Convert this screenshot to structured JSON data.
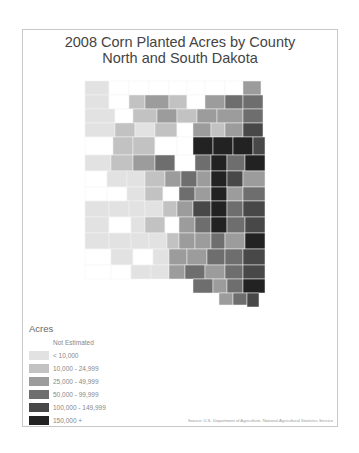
{
  "title": {
    "line1": "2008 Corn Planted Acres by County",
    "line2": "North and South Dakota"
  },
  "legend": {
    "title": "Acres",
    "classes": [
      {
        "label": "Not Estimated",
        "color": "#ffffff"
      },
      {
        "label": "< 10,000",
        "color": "#e2e2e2"
      },
      {
        "label": "10,000 - 24,999",
        "color": "#c2c2c2"
      },
      {
        "label": "25,000 - 49,999",
        "color": "#9c9c9c"
      },
      {
        "label": "50,000 - 99,999",
        "color": "#6e6e6e"
      },
      {
        "label": "100,000 - 149,999",
        "color": "#484848"
      },
      {
        "label": "150,000 +",
        "color": "#222222"
      }
    ]
  },
  "source": "Source: U.S. Department of Agriculture, National Agricultural Statistics Service",
  "map": {
    "states": [
      "North Dakota",
      "South Dakota"
    ],
    "counties": [
      [
        62,
        51,
        24,
        14,
        1
      ],
      [
        86,
        51,
        20,
        14,
        0
      ],
      [
        106,
        51,
        20,
        14,
        0
      ],
      [
        126,
        51,
        20,
        14,
        0
      ],
      [
        146,
        51,
        18,
        14,
        0
      ],
      [
        164,
        51,
        18,
        14,
        0
      ],
      [
        182,
        51,
        20,
        14,
        0
      ],
      [
        202,
        51,
        18,
        14,
        0
      ],
      [
        220,
        51,
        18,
        14,
        3
      ],
      [
        62,
        65,
        24,
        14,
        1
      ],
      [
        86,
        65,
        20,
        14,
        0
      ],
      [
        106,
        65,
        16,
        14,
        2
      ],
      [
        122,
        65,
        24,
        14,
        3
      ],
      [
        146,
        65,
        18,
        14,
        2
      ],
      [
        164,
        65,
        18,
        14,
        0
      ],
      [
        182,
        65,
        20,
        14,
        3
      ],
      [
        202,
        65,
        18,
        14,
        4
      ],
      [
        220,
        65,
        20,
        14,
        4
      ],
      [
        62,
        79,
        30,
        14,
        1
      ],
      [
        92,
        79,
        18,
        14,
        0
      ],
      [
        110,
        79,
        24,
        14,
        2
      ],
      [
        134,
        79,
        20,
        14,
        3
      ],
      [
        154,
        79,
        20,
        14,
        2
      ],
      [
        174,
        79,
        20,
        14,
        3
      ],
      [
        194,
        79,
        26,
        14,
        3
      ],
      [
        220,
        79,
        20,
        14,
        4
      ],
      [
        62,
        93,
        30,
        14,
        1
      ],
      [
        92,
        93,
        20,
        14,
        2
      ],
      [
        112,
        93,
        20,
        14,
        1
      ],
      [
        132,
        93,
        22,
        14,
        2
      ],
      [
        154,
        93,
        16,
        14,
        0
      ],
      [
        170,
        93,
        18,
        14,
        3
      ],
      [
        188,
        93,
        14,
        14,
        2
      ],
      [
        202,
        93,
        18,
        14,
        3
      ],
      [
        220,
        93,
        20,
        14,
        5
      ],
      [
        62,
        107,
        28,
        18,
        0
      ],
      [
        90,
        107,
        20,
        18,
        2
      ],
      [
        110,
        107,
        22,
        18,
        2
      ],
      [
        132,
        107,
        22,
        18,
        0
      ],
      [
        154,
        107,
        16,
        18,
        0
      ],
      [
        170,
        107,
        20,
        18,
        6
      ],
      [
        190,
        107,
        20,
        18,
        6
      ],
      [
        210,
        107,
        20,
        18,
        6
      ],
      [
        230,
        107,
        12,
        18,
        5
      ],
      [
        62,
        125,
        26,
        16,
        1
      ],
      [
        88,
        125,
        22,
        16,
        2
      ],
      [
        110,
        125,
        22,
        16,
        3
      ],
      [
        132,
        125,
        20,
        16,
        4
      ],
      [
        152,
        125,
        20,
        16,
        0
      ],
      [
        172,
        125,
        16,
        16,
        4
      ],
      [
        188,
        125,
        16,
        16,
        6
      ],
      [
        204,
        125,
        18,
        16,
        4
      ],
      [
        222,
        125,
        20,
        16,
        6
      ],
      [
        62,
        141,
        22,
        16,
        0
      ],
      [
        84,
        141,
        20,
        16,
        1
      ],
      [
        104,
        141,
        18,
        16,
        1
      ],
      [
        122,
        141,
        20,
        16,
        2
      ],
      [
        142,
        141,
        16,
        16,
        3
      ],
      [
        158,
        141,
        16,
        16,
        4
      ],
      [
        174,
        141,
        14,
        16,
        3
      ],
      [
        188,
        141,
        16,
        16,
        6
      ],
      [
        204,
        141,
        16,
        16,
        5
      ],
      [
        220,
        141,
        22,
        16,
        3
      ],
      [
        62,
        157,
        22,
        14,
        0
      ],
      [
        84,
        157,
        20,
        14,
        0
      ],
      [
        104,
        157,
        18,
        14,
        1
      ],
      [
        122,
        157,
        18,
        14,
        2
      ],
      [
        140,
        157,
        16,
        14,
        0
      ],
      [
        156,
        157,
        16,
        14,
        4
      ],
      [
        172,
        157,
        16,
        14,
        3
      ],
      [
        188,
        157,
        16,
        14,
        6
      ],
      [
        204,
        157,
        16,
        14,
        3
      ],
      [
        220,
        157,
        22,
        14,
        4
      ],
      [
        62,
        171,
        24,
        16,
        1
      ],
      [
        86,
        171,
        20,
        16,
        1
      ],
      [
        106,
        171,
        16,
        16,
        1
      ],
      [
        122,
        171,
        18,
        16,
        1
      ],
      [
        140,
        171,
        14,
        16,
        2
      ],
      [
        154,
        171,
        16,
        16,
        3
      ],
      [
        170,
        171,
        18,
        16,
        5
      ],
      [
        188,
        171,
        16,
        16,
        6
      ],
      [
        204,
        171,
        16,
        16,
        4
      ],
      [
        220,
        171,
        22,
        16,
        5
      ],
      [
        62,
        187,
        24,
        16,
        1
      ],
      [
        86,
        187,
        22,
        16,
        0
      ],
      [
        108,
        187,
        14,
        16,
        1
      ],
      [
        122,
        187,
        20,
        16,
        2
      ],
      [
        142,
        187,
        14,
        16,
        0
      ],
      [
        156,
        187,
        16,
        16,
        3
      ],
      [
        172,
        187,
        16,
        16,
        4
      ],
      [
        188,
        187,
        16,
        16,
        6
      ],
      [
        204,
        187,
        18,
        16,
        4
      ],
      [
        222,
        187,
        20,
        16,
        5
      ],
      [
        62,
        203,
        24,
        16,
        1
      ],
      [
        86,
        203,
        22,
        16,
        1
      ],
      [
        108,
        203,
        18,
        16,
        1
      ],
      [
        126,
        203,
        18,
        16,
        1
      ],
      [
        144,
        203,
        12,
        16,
        2
      ],
      [
        156,
        203,
        16,
        16,
        3
      ],
      [
        172,
        203,
        16,
        16,
        3
      ],
      [
        188,
        203,
        14,
        16,
        4
      ],
      [
        202,
        203,
        20,
        16,
        3
      ],
      [
        222,
        203,
        20,
        16,
        6
      ],
      [
        62,
        219,
        26,
        16,
        0
      ],
      [
        88,
        219,
        22,
        16,
        1
      ],
      [
        110,
        219,
        20,
        16,
        0
      ],
      [
        130,
        219,
        16,
        16,
        1
      ],
      [
        146,
        219,
        18,
        16,
        3
      ],
      [
        164,
        219,
        20,
        16,
        3
      ],
      [
        184,
        219,
        18,
        16,
        4
      ],
      [
        202,
        219,
        18,
        16,
        4
      ],
      [
        220,
        219,
        22,
        16,
        5
      ],
      [
        62,
        235,
        26,
        14,
        0
      ],
      [
        88,
        235,
        20,
        14,
        0
      ],
      [
        108,
        235,
        20,
        14,
        1
      ],
      [
        128,
        235,
        18,
        14,
        1
      ],
      [
        146,
        235,
        16,
        14,
        3
      ],
      [
        162,
        235,
        20,
        14,
        4
      ],
      [
        182,
        235,
        20,
        14,
        3
      ],
      [
        202,
        235,
        18,
        14,
        4
      ],
      [
        220,
        235,
        22,
        14,
        5
      ],
      [
        170,
        249,
        20,
        14,
        4
      ],
      [
        190,
        249,
        14,
        14,
        3
      ],
      [
        204,
        249,
        16,
        14,
        4
      ],
      [
        220,
        249,
        22,
        14,
        6
      ],
      [
        196,
        263,
        14,
        12,
        3
      ],
      [
        210,
        263,
        14,
        12,
        4
      ],
      [
        224,
        263,
        12,
        14,
        5
      ]
    ]
  }
}
